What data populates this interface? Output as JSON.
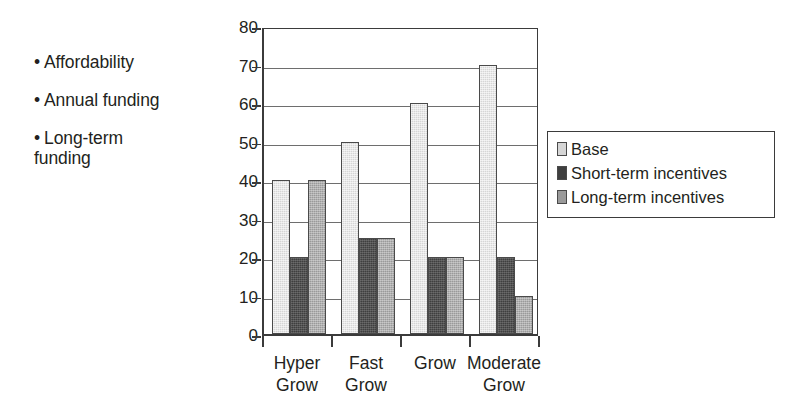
{
  "bullets": [
    {
      "marker": "•",
      "text": "Affordability"
    },
    {
      "marker": "•",
      "text": "Annual funding"
    },
    {
      "marker": "•",
      "text": "Long-term\nfunding"
    }
  ],
  "legend": {
    "entries": [
      {
        "label": "Base",
        "color": "#d6d6d6"
      },
      {
        "label": "Short-term incentives",
        "color": "#3f3f3f"
      },
      {
        "label": "Long-term incentives",
        "color": "#9a9a9a"
      }
    ]
  },
  "axis": {
    "y_ticks": [
      "0",
      "10",
      "20",
      "30",
      "40",
      "50",
      "60",
      "70",
      "80"
    ],
    "x_labels": [
      "Hyper\nGrow",
      "Fast\nGrow",
      "Grow",
      "Moderate\nGrow"
    ]
  },
  "chart_data": {
    "type": "bar",
    "title": "",
    "xlabel": "",
    "ylabel": "",
    "ylim": [
      0,
      80
    ],
    "ytick_step": 10,
    "grid": true,
    "legend_position": "right-inside",
    "categories": [
      "Hyper Grow",
      "Fast Grow",
      "Grow",
      "Moderate Grow"
    ],
    "series": [
      {
        "name": "Base",
        "color": "#d6d6d6",
        "values": [
          40,
          50,
          60,
          70
        ]
      },
      {
        "name": "Short-term incentives",
        "color": "#3f3f3f",
        "values": [
          20,
          25,
          20,
          20
        ]
      },
      {
        "name": "Long-term incentives",
        "color": "#9a9a9a",
        "values": [
          40,
          25,
          20,
          10
        ]
      }
    ]
  }
}
